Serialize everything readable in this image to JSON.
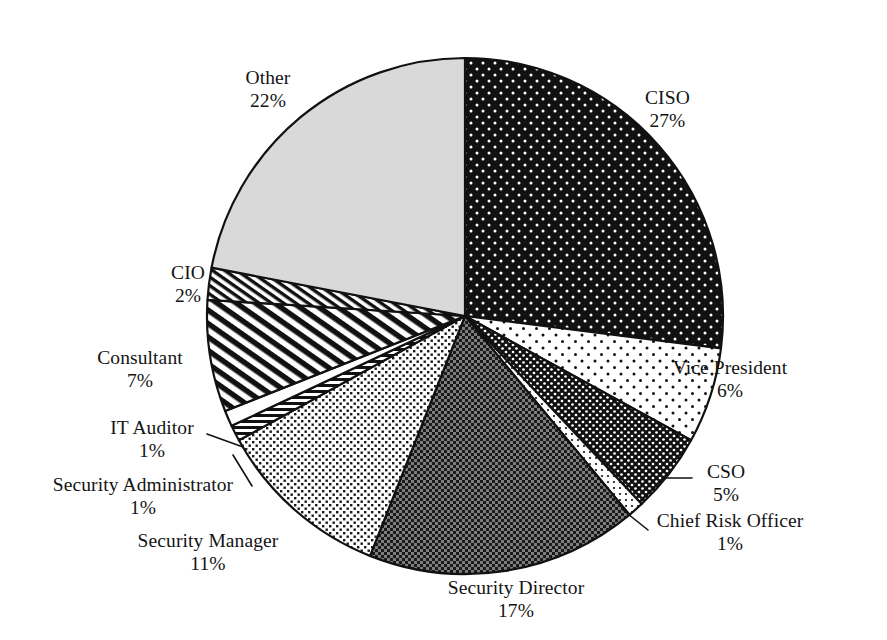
{
  "chart_data": {
    "type": "pie",
    "title": "",
    "subtitle": "",
    "xlabel": "",
    "ylabel": "",
    "legend_position": "none",
    "grid": false,
    "label_format": "name + percent",
    "start_angle_deg": 0,
    "direction": "clockwise",
    "units": "percent",
    "total": 100,
    "categories": [
      "CISO",
      "Vice President",
      "CSO",
      "Chief Risk Officer",
      "Security Director",
      "Security Manager",
      "Security Administrator",
      "IT Auditor",
      "Consultant",
      "CIO",
      "Other"
    ],
    "values": [
      27,
      6,
      5,
      1,
      17,
      11,
      1,
      1,
      7,
      2,
      22
    ],
    "slices": [
      {
        "name": "CISO",
        "percent": 27,
        "percent_label": "27%",
        "fill": "black-with-white-dots",
        "base_color": "#111111",
        "label_x": 645,
        "label_y": 110,
        "label_align": "lbl-right",
        "leader": false
      },
      {
        "name": "Vice President",
        "percent": 6,
        "percent_label": "6%",
        "fill": "white-with-black-dots",
        "base_color": "#ffffff",
        "label_x": 730,
        "label_y": 380,
        "label_align": "lbl-center",
        "leader": false
      },
      {
        "name": "CSO",
        "percent": 5,
        "percent_label": "5%",
        "fill": "black-with-dense-white-dots",
        "base_color": "#111111",
        "label_x": 726,
        "label_y": 484,
        "label_align": "lbl-center",
        "leader": true
      },
      {
        "name": "Chief Risk Officer",
        "percent": 1,
        "percent_label": "1%",
        "fill": "white-with-fine-dots",
        "base_color": "#ffffff",
        "label_x": 730,
        "label_y": 533,
        "label_align": "lbl-center",
        "leader": true
      },
      {
        "name": "Security Director",
        "percent": 17,
        "percent_label": "17%",
        "fill": "dark-checkerboard",
        "base_color": "#6e6e6e",
        "label_x": 516,
        "label_y": 600,
        "label_align": "lbl-center",
        "leader": false
      },
      {
        "name": "Security Manager",
        "percent": 11,
        "percent_label": "11%",
        "fill": "light-checkerboard",
        "base_color": "#bdbdbd",
        "label_x": 208,
        "label_y": 553,
        "label_align": "lbl-center",
        "leader": false
      },
      {
        "name": "Security Administrator",
        "percent": 1,
        "percent_label": "1%",
        "fill": "horizontal-stripes",
        "base_color": "#ffffff",
        "label_x": 143,
        "label_y": 497,
        "label_align": "lbl-center",
        "leader": true
      },
      {
        "name": "IT Auditor",
        "percent": 1,
        "percent_label": "1%",
        "fill": "solid-white",
        "base_color": "#ffffff",
        "label_x": 152,
        "label_y": 440,
        "label_align": "lbl-center",
        "leader": true
      },
      {
        "name": "Consultant",
        "percent": 7,
        "percent_label": "7%",
        "fill": "coarse-diagonal-hatch",
        "base_color": "#ffffff",
        "label_x": 140,
        "label_y": 370,
        "label_align": "lbl-center",
        "leader": false
      },
      {
        "name": "CIO",
        "percent": 2,
        "percent_label": "2%",
        "fill": "fine-diagonal-hatch",
        "base_color": "#ffffff",
        "label_x": 188,
        "label_y": 285,
        "label_align": "lbl-center",
        "leader": false
      },
      {
        "name": "Other",
        "percent": 22,
        "percent_label": "22%",
        "fill": "light-gray-solid",
        "base_color": "#d9d9d9",
        "label_x": 268,
        "label_y": 90,
        "label_align": "lbl-center",
        "leader": false
      }
    ],
    "geometry": {
      "center_x": 465,
      "center_y": 316,
      "radius": 258
    },
    "colors": {
      "outline": "#111111",
      "background": "#ffffff",
      "text": "#141414"
    }
  }
}
